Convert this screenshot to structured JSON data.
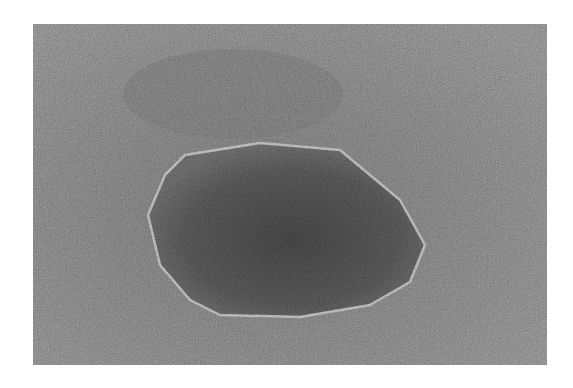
{
  "figure": {
    "colors": {
      "background_gray": "#8a8a8a",
      "particle_core": "#4a4a4a",
      "particle_mid": "#5e5e5e",
      "rim": "#bdbdbd",
      "page": "#ffffff"
    },
    "frame": {
      "x": 33,
      "y": 24,
      "width": 514,
      "height": 341
    },
    "particle_outline_points": "152,131 227,119 307,126 367,176 392,221 377,258 337,281 267,293 187,291 157,276 127,241 115,191 132,151"
  }
}
